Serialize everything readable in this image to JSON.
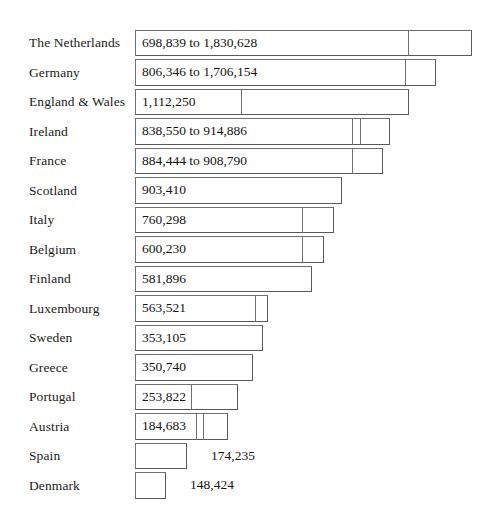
{
  "figure": {
    "type": "bar",
    "orientation": "horizontal",
    "background": "#ffffff",
    "bar_fill": "#ffffff",
    "bar_stroke": "#6f6f6f",
    "text_color": "#1a1a1a",
    "x_origin_px": 135,
    "row_height_px": 29.5,
    "first_row_top_px": 28
  },
  "chart_data": {
    "type": "bar",
    "title": "",
    "xlabel": "",
    "ylabel": "",
    "grid": false,
    "legend": null,
    "axis_visible": false,
    "tick_labels": [],
    "note": "Horizontal bar chart of population-style counts per country. Bars that show a range are drawn as a base segment (lower bound) plus an extension segment (upper bound); several rows show two nested extension dividers.",
    "categories": [
      "The Netherlands",
      "Germany",
      "England & Wales",
      "Ireland",
      "France",
      "Scotland",
      "Italy",
      "Belgium",
      "Finland",
      "Luxembourg",
      "Sweden",
      "Greece",
      "Portugal",
      "Austria",
      "Spain",
      "Denmark"
    ],
    "values": [
      1830628,
      1706154,
      1112250,
      914886,
      908790,
      903410,
      760298,
      600230,
      581896,
      563521,
      353105,
      350740,
      253822,
      184683,
      174235,
      148424
    ],
    "lower_values": [
      698839,
      806346,
      1112250,
      838550,
      884444,
      903410,
      760298,
      600230,
      581896,
      563521,
      353105,
      350740,
      253822,
      184683,
      174235,
      148424
    ],
    "rows": [
      {
        "category": "The Netherlands",
        "label": "698,839 to 1,830,628",
        "label_position": "inside",
        "low": 698839,
        "high": 1830628,
        "segments_px": [
          {
            "left": 135,
            "width": 274
          },
          {
            "left": 408,
            "width": 64
          }
        ]
      },
      {
        "category": "Germany",
        "label": "806,346 to 1,706,154",
        "label_position": "inside",
        "low": 806346,
        "high": 1706154,
        "segments_px": [
          {
            "left": 135,
            "width": 271
          },
          {
            "left": 405,
            "width": 31
          }
        ]
      },
      {
        "category": "England & Wales",
        "label": "1,112,250",
        "label_position": "inside",
        "low": 1112250,
        "high": 1112250,
        "segments_px": [
          {
            "left": 135,
            "width": 107
          },
          {
            "left": 241,
            "width": 168
          }
        ]
      },
      {
        "category": "Ireland",
        "label": "838,550 to 914,886",
        "label_position": "inside",
        "low": 838550,
        "high": 914886,
        "segments_px": [
          {
            "left": 135,
            "width": 218
          },
          {
            "left": 352,
            "width": 9
          },
          {
            "left": 360,
            "width": 30
          }
        ]
      },
      {
        "category": "France",
        "label": "884,444 to 908,790",
        "label_position": "inside",
        "low": 884444,
        "high": 908790,
        "segments_px": [
          {
            "left": 135,
            "width": 218
          },
          {
            "left": 352,
            "width": 31
          }
        ]
      },
      {
        "category": "Scotland",
        "label": "903,410",
        "label_position": "inside",
        "low": 903410,
        "high": 903410,
        "segments_px": [
          {
            "left": 135,
            "width": 207
          }
        ]
      },
      {
        "category": "Italy",
        "label": "760,298",
        "label_position": "inside",
        "low": 760298,
        "high": 760298,
        "segments_px": [
          {
            "left": 135,
            "width": 168
          },
          {
            "left": 302,
            "width": 32
          }
        ]
      },
      {
        "category": "Belgium",
        "label": "600,230",
        "label_position": "inside",
        "low": 600230,
        "high": 600230,
        "segments_px": [
          {
            "left": 135,
            "width": 168
          },
          {
            "left": 302,
            "width": 22
          }
        ]
      },
      {
        "category": "Finland",
        "label": "581,896",
        "label_position": "inside",
        "low": 581896,
        "high": 581896,
        "segments_px": [
          {
            "left": 135,
            "width": 177
          }
        ]
      },
      {
        "category": "Luxembourg",
        "label": "563,521",
        "label_position": "inside",
        "low": 563521,
        "high": 563521,
        "segments_px": [
          {
            "left": 135,
            "width": 121
          },
          {
            "left": 255,
            "width": 13
          }
        ]
      },
      {
        "category": "Sweden",
        "label": "353,105",
        "label_position": "inside",
        "low": 353105,
        "high": 353105,
        "segments_px": [
          {
            "left": 135,
            "width": 128
          }
        ]
      },
      {
        "category": "Greece",
        "label": "350,740",
        "label_position": "inside",
        "low": 350740,
        "high": 350740,
        "segments_px": [
          {
            "left": 135,
            "width": 118
          }
        ]
      },
      {
        "category": "Portugal",
        "label": "253,822",
        "label_position": "inside",
        "low": 253822,
        "high": 253822,
        "segments_px": [
          {
            "left": 135,
            "width": 57
          },
          {
            "left": 191,
            "width": 47
          }
        ]
      },
      {
        "category": "Austria",
        "label": "184,683",
        "label_position": "inside",
        "low": 184683,
        "high": 184683,
        "segments_px": [
          {
            "left": 135,
            "width": 62
          },
          {
            "left": 196,
            "width": 8
          },
          {
            "left": 203,
            "width": 25
          }
        ]
      },
      {
        "category": "Spain",
        "label": "174,235",
        "label_position": "outside",
        "low": 174235,
        "high": 174235,
        "segments_px": [
          {
            "left": 135,
            "width": 52
          }
        ]
      },
      {
        "category": "Denmark",
        "label": "148,424",
        "label_position": "outside",
        "low": 148424,
        "high": 148424,
        "segments_px": [
          {
            "left": 135,
            "width": 31
          }
        ]
      }
    ]
  }
}
